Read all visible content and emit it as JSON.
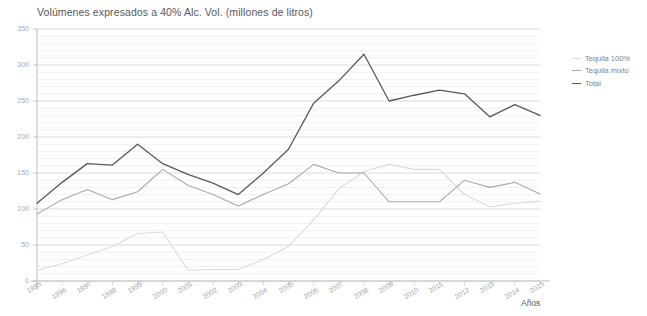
{
  "chart_data": {
    "type": "line",
    "title": "Volúmenes expresados a 40% Alc. Vol. (millones de litros)",
    "xlabel": "Años",
    "ylabel": "",
    "ylim": [
      0,
      350
    ],
    "ytick_step": 50,
    "minor_gridline_step": 10,
    "grid": true,
    "legend_position": "right",
    "categories": [
      "1995",
      "1996",
      "1997",
      "1998",
      "1999",
      "2000",
      "2001",
      "2002",
      "2003",
      "2004",
      "2005",
      "2006",
      "2007",
      "2008",
      "2009",
      "2010",
      "2011",
      "2012",
      "2013",
      "2014",
      "2015"
    ],
    "yticks": [
      "0",
      "50",
      "100",
      "150",
      "200",
      "250",
      "300",
      "350"
    ],
    "series": [
      {
        "name": "Tequila 100%",
        "color": "#d9dadb",
        "values": [
          15,
          24,
          36,
          48,
          66,
          68,
          15,
          16,
          16,
          30,
          48,
          85,
          128,
          152,
          162,
          155,
          155,
          120,
          103,
          108,
          111
        ]
      },
      {
        "name": "Tequila mixto",
        "color": "#a7a9ac",
        "values": [
          93,
          113,
          127,
          113,
          124,
          155,
          133,
          120,
          104,
          120,
          135,
          162,
          150,
          150,
          110,
          110,
          110,
          140,
          130,
          137,
          121
        ]
      },
      {
        "name": "Total",
        "color": "#58595b",
        "values": [
          108,
          137,
          163,
          161,
          190,
          163,
          148,
          136,
          120,
          150,
          183,
          247,
          278,
          315,
          250,
          258,
          265,
          260,
          228,
          245,
          230
        ]
      }
    ]
  }
}
